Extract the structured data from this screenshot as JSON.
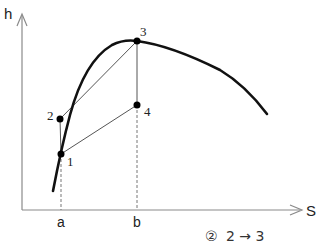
{
  "diagram": {
    "type": "h-S diagram",
    "axes": {
      "y_label": "h",
      "x_label": "S"
    },
    "ticks": {
      "a": "a",
      "b": "b"
    },
    "points": [
      {
        "id": "1",
        "label": "1",
        "x": 61,
        "y": 154
      },
      {
        "id": "2",
        "label": "2",
        "x": 60,
        "y": 119
      },
      {
        "id": "3",
        "label": "3",
        "x": 137,
        "y": 41
      },
      {
        "id": "4",
        "label": "4",
        "x": 137,
        "y": 105
      }
    ],
    "lines": [
      {
        "from": "2",
        "to": "1"
      },
      {
        "from": "2",
        "to": "3"
      },
      {
        "from": "1",
        "to": "4"
      },
      {
        "from": "3",
        "to": "4"
      }
    ],
    "dashed_lines": [
      {
        "from": "1",
        "to": "a"
      },
      {
        "from": "4",
        "to": "b"
      }
    ],
    "curve": "saturation dome (bold)",
    "colors": {
      "axis": "#888888",
      "curve": "#111111",
      "line": "#555555",
      "point": "#000000"
    }
  },
  "caption": {
    "number": "②",
    "text": "2 → 3"
  }
}
